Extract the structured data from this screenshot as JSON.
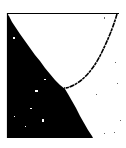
{
  "figure": {
    "background_color": "#ffffff",
    "ink_color": "#000000",
    "frame": {
      "top_line": {
        "x1": 7,
        "y1": 13.5,
        "x2": 119,
        "y2": 13.5
      },
      "left_line": {
        "x1": 7.5,
        "y1": 13,
        "x2": 7.5,
        "y2": 138
      }
    },
    "filled_region": {
      "points": "7,14 9,16 12,22 16,28 20,34 25,41 30,48 35,55 40,61 45,68 50,74 55,80 60,85 65,89 68,94 72,101 76,108 80,116 84,123 88,130 92,136 93,138 7,138"
    },
    "curve": {
      "path": "M 117 14 C 113 28, 107 42, 100 56 C 93 69, 84 80, 74 85 C 70 87, 67 88, 64 88",
      "stroke_width": 1.6
    },
    "specks": [
      {
        "x": 104,
        "y": 17,
        "w": 1,
        "h": 2
      },
      {
        "x": 115,
        "y": 62,
        "w": 1,
        "h": 1
      },
      {
        "x": 117,
        "y": 83,
        "w": 1,
        "h": 1
      },
      {
        "x": 96,
        "y": 94,
        "w": 1,
        "h": 1
      },
      {
        "x": 120,
        "y": 120,
        "w": 1,
        "h": 1
      },
      {
        "x": 104,
        "y": 133,
        "w": 1,
        "h": 1
      },
      {
        "x": 114,
        "y": 132,
        "w": 1,
        "h": 1
      }
    ],
    "holes": [
      {
        "x": 13,
        "y": 37,
        "w": 2,
        "h": 2
      },
      {
        "x": 44,
        "y": 79,
        "w": 2,
        "h": 1
      },
      {
        "x": 35,
        "y": 90,
        "w": 3,
        "h": 2
      },
      {
        "x": 30,
        "y": 108,
        "w": 2,
        "h": 1
      },
      {
        "x": 42,
        "y": 119,
        "w": 2,
        "h": 3
      },
      {
        "x": 14,
        "y": 116,
        "w": 1,
        "h": 1
      },
      {
        "x": 25,
        "y": 126,
        "w": 1,
        "h": 1
      }
    ]
  }
}
